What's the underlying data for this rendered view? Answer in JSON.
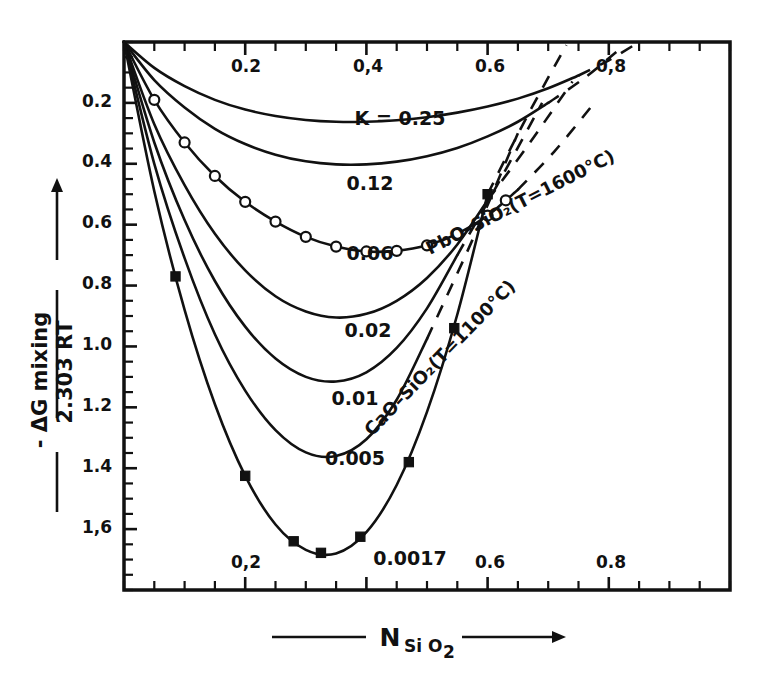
{
  "figure": {
    "background": "#ffffff",
    "ink_color": "#111111"
  },
  "axes": {
    "x_title_main": "N",
    "x_title_sub": "Si O",
    "x_title_sub2": "2",
    "y_title_numerator": "- ΔG mixing",
    "y_title_denominator": "2.303 RT",
    "x_top_ticks": [
      "0.2",
      "0,4",
      "0.6",
      "0,8"
    ],
    "x_bottom_ticks": [
      "0,2",
      "0.6",
      "0.8"
    ],
    "y_ticks": [
      "0.2",
      "0.4",
      "0.6",
      "0.8",
      "1.0",
      "1.2",
      "1.4",
      "1,6"
    ],
    "x_range": [
      0,
      1
    ],
    "y_range": [
      0,
      1.8
    ]
  },
  "curve_labels": [
    "K = 0.25",
    "0.12",
    "0.06",
    "0.02",
    "0.01",
    "0.005",
    "0.0017"
  ],
  "series_labels": [
    "PbO–SiO₂(T=1600°C)",
    "CaO–SiO₂(T=1100°C)"
  ],
  "chart_data": {
    "type": "line",
    "title": "",
    "xlabel": "N SiO2",
    "ylabel": "- ΔG mixing / 2.303 RT",
    "xlim": [
      0,
      1
    ],
    "ylim": [
      0,
      1.8
    ],
    "y_inverted": true,
    "grid": false,
    "legend": "inline-curve-labels",
    "x_tick_labels_top": [
      0.2,
      0.4,
      0.6,
      0.8
    ],
    "x_tick_labels_bottom": [
      0.2,
      0.6,
      0.8
    ],
    "y_tick_labels": [
      0.2,
      0.4,
      0.6,
      0.8,
      1.0,
      1.2,
      1.4,
      1.6
    ],
    "x_minor_tick_step": 0.05,
    "y_minor_tick_step": 0.05,
    "series": [
      {
        "name": "K = 0.25",
        "label": "K = 0.25",
        "style": "solid-with-dashed-extension",
        "markers": "none",
        "x": [
          0.0,
          0.05,
          0.1,
          0.15,
          0.2,
          0.25,
          0.3,
          0.35,
          0.4,
          0.45,
          0.5,
          0.55,
          0.6,
          0.65,
          0.7,
          0.75
        ],
        "y": [
          0.0,
          0.085,
          0.145,
          0.19,
          0.222,
          0.243,
          0.256,
          0.262,
          0.262,
          0.257,
          0.247,
          0.232,
          0.212,
          0.186,
          0.152,
          0.11
        ],
        "dashed_x": [
          0.75,
          0.8,
          0.85
        ],
        "dashed_y": [
          0.11,
          0.06,
          0.0
        ]
      },
      {
        "name": "K = 0.12",
        "label": "0.12",
        "style": "solid-with-dashed-extension",
        "markers": "none",
        "x": [
          0.0,
          0.05,
          0.1,
          0.15,
          0.2,
          0.25,
          0.3,
          0.35,
          0.4,
          0.45,
          0.5,
          0.55,
          0.6,
          0.65,
          0.7
        ],
        "y": [
          0.0,
          0.125,
          0.215,
          0.285,
          0.335,
          0.37,
          0.392,
          0.402,
          0.402,
          0.393,
          0.375,
          0.348,
          0.31,
          0.262,
          0.2
        ],
        "dashed_x": [
          0.7,
          0.76,
          0.82
        ],
        "dashed_y": [
          0.2,
          0.118,
          0.02
        ]
      },
      {
        "name": "PbO-SiO2 (K = 0.06)",
        "label": "0.06",
        "series_label": "PbO–SiO₂(T=1600°C)",
        "style": "solid-with-dashed-extension",
        "markers": "open-circle",
        "x": [
          0.0,
          0.05,
          0.1,
          0.15,
          0.2,
          0.25,
          0.3,
          0.35,
          0.4,
          0.45,
          0.5,
          0.55,
          0.6,
          0.65
        ],
        "y": [
          0.0,
          0.19,
          0.33,
          0.44,
          0.525,
          0.59,
          0.64,
          0.672,
          0.688,
          0.686,
          0.668,
          0.63,
          0.57,
          0.485
        ],
        "marker_x": [
          0.05,
          0.1,
          0.15,
          0.2,
          0.25,
          0.3,
          0.35,
          0.4,
          0.45,
          0.5,
          0.55,
          0.6,
          0.63
        ],
        "marker_y": [
          0.19,
          0.33,
          0.44,
          0.525,
          0.59,
          0.64,
          0.672,
          0.688,
          0.686,
          0.668,
          0.63,
          0.57,
          0.52
        ],
        "dashed_x": [
          0.65,
          0.71,
          0.77
        ],
        "dashed_y": [
          0.485,
          0.36,
          0.215
        ]
      },
      {
        "name": "K = 0.02",
        "label": "0.02",
        "style": "solid-with-dashed-extension",
        "markers": "none",
        "x": [
          0.0,
          0.05,
          0.1,
          0.15,
          0.2,
          0.25,
          0.3,
          0.35,
          0.4,
          0.45,
          0.5,
          0.55,
          0.6
        ],
        "y": [
          0.0,
          0.27,
          0.47,
          0.63,
          0.75,
          0.835,
          0.885,
          0.905,
          0.893,
          0.85,
          0.775,
          0.665,
          0.52
        ],
        "dashed_x": [
          0.6,
          0.67,
          0.74
        ],
        "dashed_y": [
          0.52,
          0.33,
          0.13
        ]
      },
      {
        "name": "K = 0.01",
        "label": "0.01",
        "style": "solid-with-dashed-extension",
        "markers": "none",
        "x": [
          0.0,
          0.05,
          0.1,
          0.15,
          0.2,
          0.25,
          0.3,
          0.35,
          0.4,
          0.45,
          0.5,
          0.55
        ],
        "y": [
          0.0,
          0.33,
          0.585,
          0.785,
          0.935,
          1.04,
          1.1,
          1.115,
          1.085,
          1.005,
          0.875,
          0.7
        ],
        "dashed_x": [
          0.55,
          0.62,
          0.69
        ],
        "dashed_y": [
          0.7,
          0.455,
          0.2
        ]
      },
      {
        "name": "K = 0.005",
        "label": "0.005",
        "style": "solid-with-dashed-extension",
        "markers": "none",
        "x": [
          0.0,
          0.05,
          0.1,
          0.15,
          0.2,
          0.25,
          0.3,
          0.35,
          0.4,
          0.45,
          0.5
        ],
        "y": [
          0.0,
          0.4,
          0.71,
          0.96,
          1.145,
          1.275,
          1.348,
          1.36,
          1.305,
          1.175,
          0.975
        ],
        "dashed_x": [
          0.5,
          0.575,
          0.65
        ],
        "dashed_y": [
          0.975,
          0.65,
          0.3
        ]
      },
      {
        "name": "CaO-SiO2 (K = 0.0017)",
        "label": "0.0017",
        "series_label": "CaO–SiO₂(T=1100°C)",
        "style": "solid-with-dashed-extension",
        "markers": "filled-square",
        "x": [
          0.0,
          0.05,
          0.1,
          0.15,
          0.2,
          0.25,
          0.3,
          0.35,
          0.4,
          0.45,
          0.5,
          0.55,
          0.6
        ],
        "y": [
          0.0,
          0.49,
          0.88,
          1.19,
          1.425,
          1.585,
          1.668,
          1.68,
          1.61,
          1.455,
          1.215,
          0.895,
          0.5
        ],
        "marker_x": [
          0.085,
          0.2,
          0.28,
          0.325,
          0.39,
          0.47,
          0.545,
          0.6
        ],
        "marker_y": [
          0.77,
          1.425,
          1.64,
          1.678,
          1.625,
          1.38,
          0.94,
          0.5
        ],
        "dashed_x": [
          0.6,
          0.665,
          0.73
        ],
        "dashed_y": [
          0.5,
          0.245,
          0.01
        ]
      }
    ]
  },
  "annotations": {
    "k_prefix": "K ="
  }
}
